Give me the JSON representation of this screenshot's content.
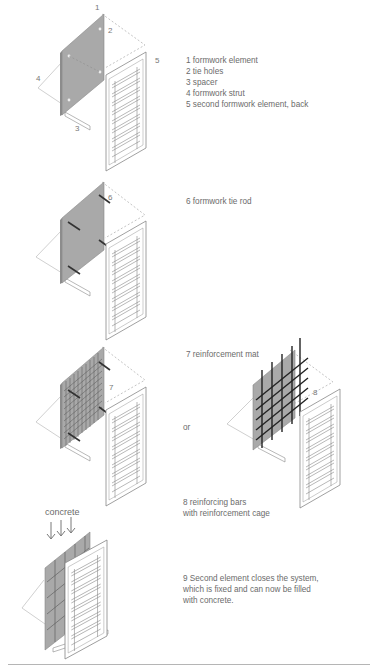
{
  "figure1": {
    "callouts": [
      "1",
      "2",
      "3",
      "4",
      "5"
    ],
    "legend": [
      "1 formwork element",
      "2 tie holes",
      "3 spacer",
      "4 formwork strut",
      "5 second formwork element, back"
    ]
  },
  "figure2": {
    "callouts": [
      "6"
    ],
    "legend": [
      "6 formwork tie rod"
    ]
  },
  "figure3": {
    "callouts": [
      "7",
      "8"
    ],
    "legend": [
      "7 reinforcement mat"
    ],
    "or_label": "or",
    "alt_legend": [
      "8 reinforcing bars",
      "with reinforcement cage"
    ]
  },
  "figure4": {
    "top_label": "concrete",
    "legend": [
      "9 Second element closes the system,",
      "which is fixed and can now be filled",
      "with concrete."
    ]
  },
  "colors": {
    "panel": "#a9a9a9",
    "panel_edge": "#8c8c8c",
    "frame": "#ffffff",
    "line": "#777777",
    "text": "#6b6b6b",
    "rebar": "#333333",
    "rule": "#b5b5b5"
  }
}
